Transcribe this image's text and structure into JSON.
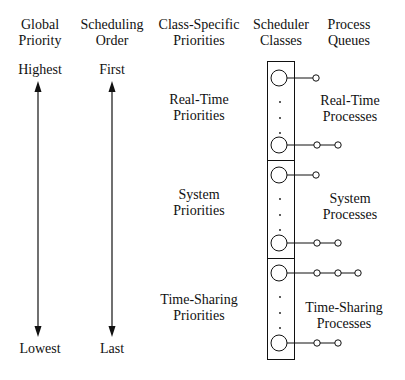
{
  "headers": {
    "global_priority": [
      "Global",
      "Priority"
    ],
    "scheduling_order": [
      "Scheduling",
      "Order"
    ],
    "class_specific": [
      "Class-Specific",
      "Priorities"
    ],
    "scheduler_classes": [
      "Scheduler",
      "Classes"
    ],
    "process_queues": [
      "Process",
      "Queues"
    ]
  },
  "global_axis": {
    "top": "Highest",
    "bottom": "Lowest"
  },
  "order_axis": {
    "top": "First",
    "bottom": "Last"
  },
  "classes": [
    {
      "priority_label": [
        "Real-Time",
        "Priorities"
      ],
      "process_label": [
        "Real-Time",
        "Processes"
      ],
      "top_queue_len": 1,
      "bottom_queue_len": 2
    },
    {
      "priority_label": [
        "System",
        "Priorities"
      ],
      "process_label": [
        "System",
        "Processes"
      ],
      "top_queue_len": 1,
      "bottom_queue_len": 2
    },
    {
      "priority_label": [
        "Time-Sharing",
        "Priorities"
      ],
      "process_label": [
        "Time-Sharing",
        "Processes"
      ],
      "top_queue_len": 3,
      "bottom_queue_len": 2
    }
  ],
  "colors": {
    "line": "#111111",
    "background": "#ffffff"
  }
}
